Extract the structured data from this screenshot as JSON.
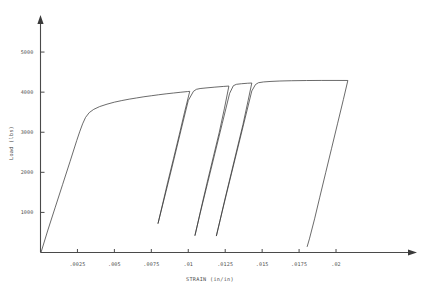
{
  "chart_data": {
    "type": "line",
    "title": "",
    "xlabel": "STRAIN (in/in)",
    "ylabel": "Load (lbs)",
    "xlim": [
      0,
      0.0246
    ],
    "ylim": [
      0,
      5700
    ],
    "grid": false,
    "legend": null,
    "xticks": [
      0.0025,
      0.005,
      0.0075,
      0.01,
      0.0125,
      0.015,
      0.0175,
      0.02
    ],
    "xticklabels": [
      ".0025",
      ".005",
      ".0075",
      ".01",
      ".0125",
      ".015",
      ".0175",
      ".02"
    ],
    "yticks": [
      1000,
      2000,
      3000,
      4000,
      5000
    ],
    "yticklabels": [
      "1000",
      "2000",
      "3000",
      "4000",
      "5000"
    ],
    "series": [
      {
        "name": "load-strain cyclic curve",
        "points": [
          [
            5e-05,
            20
          ],
          [
            0.0005,
            560
          ],
          [
            0.001,
            1130
          ],
          [
            0.0015,
            1700
          ],
          [
            0.002,
            2270
          ],
          [
            0.00245,
            2790
          ],
          [
            0.00265,
            3010
          ],
          [
            0.00285,
            3210
          ],
          [
            0.00305,
            3370
          ],
          [
            0.0033,
            3490
          ],
          [
            0.0036,
            3570
          ],
          [
            0.004,
            3640
          ],
          [
            0.0045,
            3700
          ],
          [
            0.005,
            3750
          ],
          [
            0.0055,
            3790
          ],
          [
            0.006,
            3825
          ],
          [
            0.0065,
            3855
          ],
          [
            0.007,
            3885
          ],
          [
            0.0075,
            3910
          ],
          [
            0.008,
            3935
          ],
          [
            0.0085,
            3958
          ],
          [
            0.009,
            3978
          ],
          [
            0.0095,
            3998
          ],
          [
            0.00995,
            4015
          ],
          [
            0.0101,
            4020
          ],
          [
            0.00975,
            3500
          ],
          [
            0.0094,
            2950
          ],
          [
            0.009,
            2340
          ],
          [
            0.0086,
            1740
          ],
          [
            0.00825,
            1190
          ],
          [
            0.00795,
            720
          ],
          [
            0.0085,
            1530
          ],
          [
            0.009,
            2280
          ],
          [
            0.0095,
            3040
          ],
          [
            0.01,
            3790
          ],
          [
            0.01035,
            4020
          ],
          [
            0.01055,
            4070
          ],
          [
            0.0108,
            4090
          ],
          [
            0.0112,
            4105
          ],
          [
            0.0118,
            4125
          ],
          [
            0.0124,
            4143
          ],
          [
            0.01275,
            4152
          ],
          [
            0.01245,
            3600
          ],
          [
            0.0121,
            3000
          ],
          [
            0.0117,
            2390
          ],
          [
            0.0113,
            1780
          ],
          [
            0.01095,
            1230
          ],
          [
            0.0106,
            660
          ],
          [
            0.01045,
            420
          ],
          [
            0.0108,
            970
          ],
          [
            0.0113,
            1720
          ],
          [
            0.0118,
            2470
          ],
          [
            0.0123,
            3220
          ],
          [
            0.0128,
            3970
          ],
          [
            0.01305,
            4160
          ],
          [
            0.01325,
            4195
          ],
          [
            0.0136,
            4210
          ],
          [
            0.014,
            4222
          ],
          [
            0.0143,
            4228
          ],
          [
            0.01405,
            3790
          ],
          [
            0.0137,
            3190
          ],
          [
            0.0133,
            2580
          ],
          [
            0.0129,
            1970
          ],
          [
            0.0125,
            1360
          ],
          [
            0.01215,
            800
          ],
          [
            0.0119,
            410
          ],
          [
            0.0123,
            1030
          ],
          [
            0.0128,
            1780
          ],
          [
            0.0133,
            2530
          ],
          [
            0.0138,
            3280
          ],
          [
            0.0143,
            4030
          ],
          [
            0.01455,
            4190
          ],
          [
            0.01475,
            4235
          ],
          [
            0.0151,
            4255
          ],
          [
            0.0156,
            4268
          ],
          [
            0.0162,
            4278
          ],
          [
            0.017,
            4285
          ],
          [
            0.018,
            4290
          ],
          [
            0.019,
            4292
          ],
          [
            0.02,
            4292
          ],
          [
            0.0208,
            4291
          ],
          [
            0.0205,
            3820
          ],
          [
            0.0201,
            3210
          ],
          [
            0.0197,
            2600
          ],
          [
            0.0193,
            1990
          ],
          [
            0.0189,
            1380
          ],
          [
            0.01855,
            840
          ],
          [
            0.0182,
            340
          ],
          [
            0.01805,
            150
          ]
        ]
      }
    ]
  },
  "axes": {
    "y_axis_name": "load-axis",
    "x_axis_name": "strain-axis"
  }
}
